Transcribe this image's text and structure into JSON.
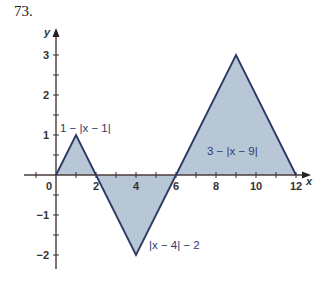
{
  "problem_number": "73.",
  "chart_data": {
    "type": "area",
    "title": "",
    "xlabel": "x",
    "ylabel": "y",
    "xlim": [
      -1.5,
      12.5
    ],
    "ylim": [
      -2.3,
      3.6
    ],
    "x_ticks": [
      0,
      2,
      4,
      6,
      8,
      10,
      12
    ],
    "x_tick_labels": [
      "0",
      "2",
      "4",
      "6",
      "8",
      "10",
      "12"
    ],
    "y_ticks": [
      -2,
      -1,
      1,
      2,
      3
    ],
    "y_tick_labels": [
      "-2",
      "-1",
      "1",
      "2",
      "3"
    ],
    "grid": false,
    "fill_color": "#b7c7d6",
    "line_color": "#2b3566",
    "series": [
      {
        "name": "1 − |x − 1|",
        "x": [
          0,
          1,
          2
        ],
        "y": [
          0,
          1,
          0
        ]
      },
      {
        "name": "|x − 4| − 2",
        "x": [
          2,
          4,
          6
        ],
        "y": [
          0,
          -2,
          0
        ]
      },
      {
        "name": "3 − |x − 9|",
        "x": [
          6,
          9,
          12
        ],
        "y": [
          0,
          3,
          0
        ]
      }
    ],
    "annotations": [
      {
        "text": "1 − |x − 1|",
        "x": 0.2,
        "y": 1.2
      },
      {
        "text": "|x − 4| − 2",
        "x": 4.3,
        "y": -1.8
      },
      {
        "text": "3 − |x − 9|",
        "x": 7.5,
        "y": 0.7
      }
    ]
  }
}
